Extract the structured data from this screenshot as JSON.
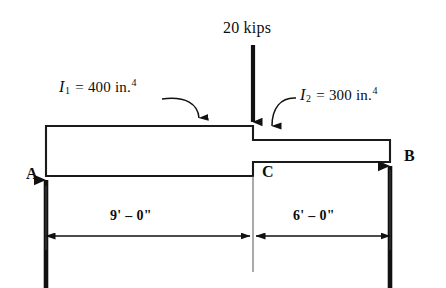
{
  "figure": {
    "load": {
      "magnitude_label": "20 kips",
      "value": 20,
      "unit": "kips",
      "direction": "down",
      "applied_at": "C"
    },
    "members": [
      {
        "id": "I1",
        "label_symbol": "I",
        "label_subscript": "1",
        "equals": "=",
        "value": "400",
        "unit": "in.",
        "unit_exponent": "4",
        "full_label": "I1 = 400 in.4",
        "span_label": "9' – 0\"",
        "span_feet": 9,
        "span_inches": 0
      },
      {
        "id": "I2",
        "label_symbol": "I",
        "label_subscript": "2",
        "equals": "=",
        "value": "300",
        "unit": "in.",
        "unit_exponent": "4",
        "full_label": "I2 = 300 in.4",
        "span_label": "6' – 0\"",
        "span_feet": 6,
        "span_inches": 0
      }
    ],
    "supports": [
      {
        "id": "A",
        "label": "A",
        "position": "left",
        "reaction": "up"
      },
      {
        "id": "C",
        "label": "C",
        "position": "step",
        "reaction": "none"
      },
      {
        "id": "B",
        "label": "B",
        "position": "right",
        "reaction": "up"
      }
    ],
    "dimensions": [
      {
        "label": "9' – 0\"",
        "from": "A",
        "to": "C"
      },
      {
        "label": "6' – 0\"",
        "from": "C",
        "to": "B"
      }
    ],
    "colors": {
      "ink": "#111111",
      "background": "#ffffff",
      "outline": "#1a1a1a"
    }
  }
}
